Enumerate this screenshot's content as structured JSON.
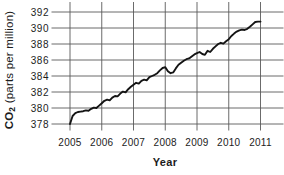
{
  "figure": {
    "background": "#ffffff",
    "line_color": "#141414",
    "grid_color": "#5a5a5a",
    "text_color": "#1c1c1c"
  },
  "chart_data": {
    "type": "line",
    "title": "",
    "xlabel": "Year",
    "ylabel": "CO2 (parts per million)",
    "ylabel_prefix": "CO",
    "ylabel_subscript": "2",
    "ylabel_rest": " (parts per million)",
    "x_ticks": [
      2005,
      2006,
      2007,
      2008,
      2009,
      2010,
      2011
    ],
    "y_ticks": [
      378,
      380,
      382,
      384,
      386,
      388,
      390,
      392
    ],
    "xlim": [
      2005,
      2011
    ],
    "ylim": [
      378,
      392
    ],
    "grid": true,
    "legend": false,
    "series": [
      {
        "name": "Atmospheric CO2 concentration",
        "x": [
          2005.0,
          2005.083,
          2005.167,
          2005.25,
          2005.333,
          2005.417,
          2005.5,
          2005.583,
          2005.667,
          2005.75,
          2005.833,
          2005.917,
          2006.0,
          2006.083,
          2006.167,
          2006.25,
          2006.333,
          2006.417,
          2006.5,
          2006.583,
          2006.667,
          2006.75,
          2006.833,
          2006.917,
          2007.0,
          2007.083,
          2007.167,
          2007.25,
          2007.333,
          2007.417,
          2007.5,
          2007.583,
          2007.667,
          2007.75,
          2007.833,
          2007.917,
          2008.0,
          2008.083,
          2008.167,
          2008.25,
          2008.333,
          2008.417,
          2008.5,
          2008.583,
          2008.667,
          2008.75,
          2008.833,
          2008.917,
          2009.0,
          2009.083,
          2009.167,
          2009.25,
          2009.333,
          2009.417,
          2009.5,
          2009.583,
          2009.667,
          2009.75,
          2009.833,
          2009.917,
          2010.0,
          2010.083,
          2010.167,
          2010.25,
          2010.333,
          2010.417,
          2010.5,
          2010.583,
          2010.667,
          2010.75,
          2010.833,
          2010.917,
          2011.0
        ],
        "y": [
          378.0,
          379.0,
          379.35,
          379.5,
          379.55,
          379.6,
          379.7,
          379.65,
          379.9,
          380.05,
          380.0,
          380.3,
          380.6,
          380.9,
          381.05,
          380.95,
          381.3,
          381.5,
          381.45,
          381.8,
          382.05,
          381.95,
          382.35,
          382.65,
          382.9,
          383.15,
          383.05,
          383.4,
          383.55,
          383.45,
          383.85,
          384.0,
          384.15,
          384.35,
          384.7,
          385.0,
          385.1,
          384.6,
          384.35,
          384.45,
          384.95,
          385.4,
          385.65,
          385.9,
          386.1,
          386.2,
          386.45,
          386.7,
          386.85,
          387.0,
          386.75,
          386.65,
          387.15,
          387.0,
          387.4,
          387.7,
          388.0,
          388.15,
          388.05,
          388.35,
          388.6,
          389.0,
          389.3,
          389.55,
          389.7,
          389.8,
          389.75,
          389.9,
          390.15,
          390.45,
          390.75,
          390.8,
          390.8
        ]
      }
    ]
  }
}
